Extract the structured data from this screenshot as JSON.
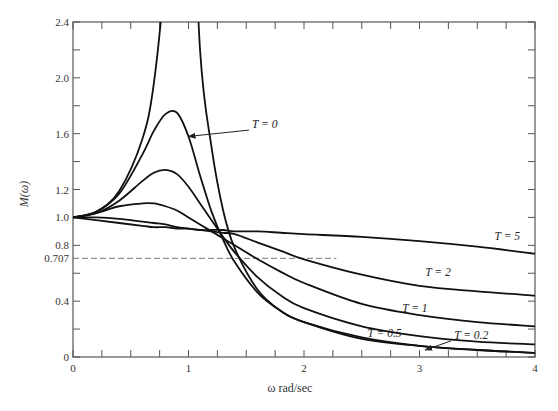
{
  "chart_data": {
    "type": "line",
    "title": "",
    "xlabel": "ω rad/sec",
    "ylabel": "M(ω)",
    "xlim": [
      0,
      4
    ],
    "ylim": [
      0,
      2.4
    ],
    "grid": false,
    "x_ticks": [
      "0",
      "1",
      "2",
      "3",
      "4"
    ],
    "y_ticks": [
      "0",
      "0.4",
      "0.707",
      "0.8",
      "1.0",
      "1.2",
      "1.6",
      "2.0",
      "2.4"
    ],
    "reference_line": {
      "y": 0.707,
      "x_range": [
        0,
        2.28
      ],
      "style": "dashed",
      "label": "0.707"
    },
    "x": [
      0,
      0.2,
      0.4,
      0.6,
      0.7,
      0.8,
      0.9,
      1.0,
      1.1,
      1.2,
      1.3,
      1.4,
      1.6,
      1.8,
      2.0,
      2.5,
      3.0,
      3.5,
      4.0
    ],
    "series": [
      {
        "name": "T = 0",
        "label": "T = 0",
        "values": [
          1.0,
          1.04,
          1.19,
          1.56,
          1.96,
          2.78,
          4.0,
          4.0,
          2.2,
          1.5,
          1.05,
          0.78,
          0.48,
          0.33,
          0.25,
          0.13,
          0.08,
          0.05,
          0.03
        ]
      },
      {
        "name": "T = 0.2",
        "label": "T = 0.2",
        "values": [
          1.0,
          1.04,
          1.17,
          1.45,
          1.62,
          1.74,
          1.75,
          1.58,
          1.3,
          1.04,
          0.84,
          0.68,
          0.46,
          0.33,
          0.25,
          0.14,
          0.08,
          0.05,
          0.03
        ]
      },
      {
        "name": "T = 0.5",
        "label": "T = 0.5",
        "values": [
          1.0,
          1.03,
          1.12,
          1.26,
          1.32,
          1.34,
          1.31,
          1.22,
          1.1,
          0.98,
          0.86,
          0.75,
          0.57,
          0.44,
          0.35,
          0.22,
          0.15,
          0.11,
          0.09
        ]
      },
      {
        "name": "T = 1",
        "label": "T = 1",
        "values": [
          1.0,
          1.03,
          1.08,
          1.1,
          1.1,
          1.08,
          1.05,
          1.0,
          0.95,
          0.9,
          0.85,
          0.8,
          0.7,
          0.61,
          0.53,
          0.38,
          0.3,
          0.25,
          0.22
        ]
      },
      {
        "name": "T = 2",
        "label": "T = 2",
        "values": [
          1.0,
          1.0,
          0.99,
          0.97,
          0.96,
          0.95,
          0.93,
          0.92,
          0.91,
          0.9,
          0.89,
          0.88,
          0.82,
          0.76,
          0.7,
          0.59,
          0.51,
          0.47,
          0.44
        ]
      },
      {
        "name": "T = 5",
        "label": "T = 5",
        "values": [
          1.0,
          0.98,
          0.96,
          0.94,
          0.93,
          0.93,
          0.92,
          0.92,
          0.91,
          0.91,
          0.91,
          0.9,
          0.9,
          0.89,
          0.88,
          0.86,
          0.83,
          0.79,
          0.74
        ]
      }
    ],
    "annotations": [
      {
        "text": "T = 0",
        "x": 1.55,
        "y": 1.64,
        "arrow_to": [
          1.0,
          1.58
        ]
      },
      {
        "text": "T = 5",
        "x": 3.65,
        "y": 0.84
      },
      {
        "text": "T = 2",
        "x": 3.05,
        "y": 0.58
      },
      {
        "text": "T = 1",
        "x": 2.85,
        "y": 0.32
      },
      {
        "text": "T = 0.5",
        "x": 2.55,
        "y": 0.14
      },
      {
        "text": "T = 0.2",
        "x": 3.3,
        "y": 0.13,
        "arrow_to": [
          3.05,
          0.05
        ]
      }
    ]
  },
  "axes": {
    "xlabel": "ω rad/sec",
    "ylabel": "M(ω)",
    "x_tick_labels": [
      "0",
      "1",
      "2",
      "3",
      "4"
    ],
    "y_tick_labels": [
      {
        "v": 0,
        "t": "0"
      },
      {
        "v": 0.4,
        "t": "0.4"
      },
      {
        "v": 0.707,
        "t": "0.707"
      },
      {
        "v": 0.8,
        "t": "0.8"
      },
      {
        "v": 1.0,
        "t": "1.0"
      },
      {
        "v": 1.2,
        "t": "1.2"
      },
      {
        "v": 1.6,
        "t": "1.6"
      },
      {
        "v": 2.0,
        "t": "2.0"
      },
      {
        "v": 2.4,
        "t": "2.4"
      }
    ]
  }
}
